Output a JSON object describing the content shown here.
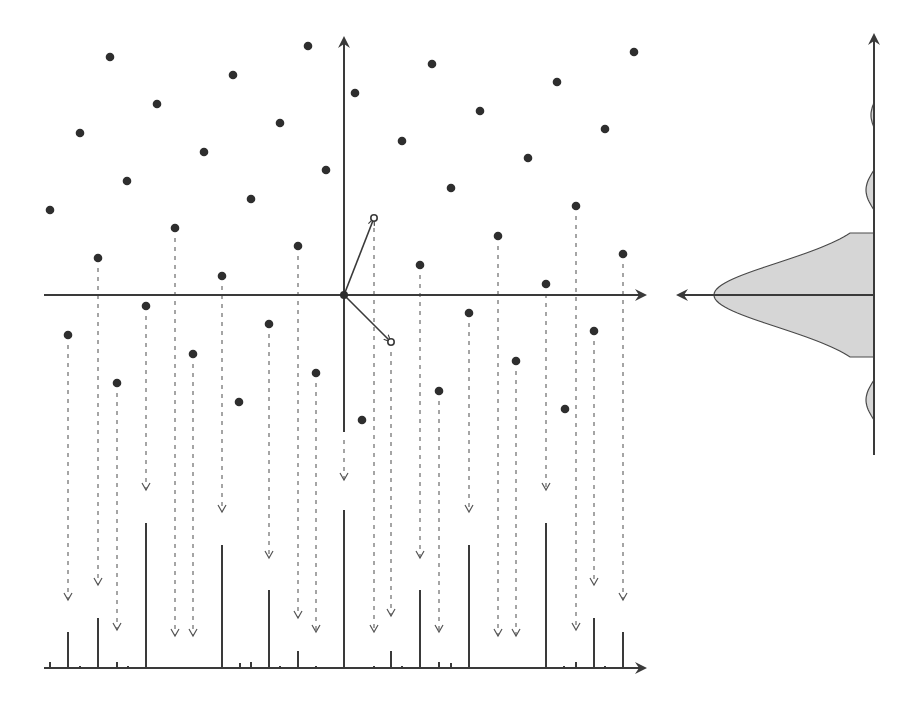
{
  "diagram": {
    "title": "",
    "colors": {
      "axis": "#3a3a3a",
      "dot": "#2e2e2e",
      "dash": "#6a6a6a",
      "profile_fill": "#d6d6d6"
    },
    "main_axes": {
      "origin": [
        344,
        295
      ],
      "x_axis": {
        "x1": 44,
        "x2": 645,
        "y": 295
      },
      "y_axis": {
        "x": 344,
        "y1": 38,
        "y2": 432
      }
    },
    "basis_vectors": [
      {
        "name": "basis-vector-1",
        "to": [
          374,
          218
        ]
      },
      {
        "name": "basis-vector-2",
        "to": [
          391,
          342
        ]
      }
    ],
    "points": [
      [
        110,
        57
      ],
      [
        308,
        46
      ],
      [
        233,
        75
      ],
      [
        157,
        104
      ],
      [
        80,
        133
      ],
      [
        280,
        123
      ],
      [
        204,
        152
      ],
      [
        127,
        181
      ],
      [
        326,
        170
      ],
      [
        50,
        210
      ],
      [
        251,
        199
      ],
      [
        175,
        228
      ],
      [
        98,
        258
      ],
      [
        298,
        246
      ],
      [
        222,
        276
      ],
      [
        355,
        93
      ],
      [
        432,
        64
      ],
      [
        480,
        111
      ],
      [
        402,
        141
      ],
      [
        528,
        158
      ],
      [
        451,
        188
      ],
      [
        557,
        82
      ],
      [
        605,
        129
      ],
      [
        634,
        52
      ],
      [
        576,
        206
      ],
      [
        498,
        236
      ],
      [
        420,
        265
      ],
      [
        546,
        284
      ],
      [
        623,
        254
      ],
      [
        68,
        335
      ],
      [
        146,
        306
      ],
      [
        117,
        383
      ],
      [
        193,
        354
      ],
      [
        269,
        324
      ],
      [
        239,
        402
      ],
      [
        316,
        373
      ],
      [
        362,
        420
      ],
      [
        469,
        313
      ],
      [
        516,
        361
      ],
      [
        439,
        391
      ],
      [
        565,
        409
      ],
      [
        594,
        331
      ]
    ],
    "projections": [
      {
        "x": 68,
        "y0": 345,
        "y1": 600
      },
      {
        "x": 98,
        "y0": 268,
        "y1": 585
      },
      {
        "x": 117,
        "y0": 393,
        "y1": 630
      },
      {
        "x": 146,
        "y0": 316,
        "y1": 490
      },
      {
        "x": 175,
        "y0": 238,
        "y1": 636
      },
      {
        "x": 193,
        "y0": 364,
        "y1": 636
      },
      {
        "x": 222,
        "y0": 286,
        "y1": 512
      },
      {
        "x": 269,
        "y0": 334,
        "y1": 558
      },
      {
        "x": 298,
        "y0": 256,
        "y1": 618
      },
      {
        "x": 316,
        "y0": 383,
        "y1": 632
      },
      {
        "x": 344,
        "y0": 440,
        "y1": 480
      },
      {
        "x": 374,
        "y0": 228,
        "y1": 632
      },
      {
        "x": 391,
        "y0": 352,
        "y1": 616
      },
      {
        "x": 420,
        "y0": 275,
        "y1": 558
      },
      {
        "x": 439,
        "y0": 401,
        "y1": 632
      },
      {
        "x": 469,
        "y0": 323,
        "y1": 512
      },
      {
        "x": 498,
        "y0": 246,
        "y1": 636
      },
      {
        "x": 516,
        "y0": 371,
        "y1": 636
      },
      {
        "x": 546,
        "y0": 294,
        "y1": 490
      },
      {
        "x": 576,
        "y0": 216,
        "y1": 630
      },
      {
        "x": 594,
        "y0": 341,
        "y1": 585
      },
      {
        "x": 623,
        "y0": 264,
        "y1": 600
      }
    ],
    "bottom_axis": {
      "x1": 44,
      "x2": 645,
      "y": 668
    },
    "stems": [
      {
        "x": 50,
        "h": 6
      },
      {
        "x": 68,
        "h": 36
      },
      {
        "x": 80,
        "h": 2
      },
      {
        "x": 98,
        "h": 50
      },
      {
        "x": 117,
        "h": 6
      },
      {
        "x": 128,
        "h": 2
      },
      {
        "x": 146,
        "h": 145
      },
      {
        "x": 193,
        "h": 1
      },
      {
        "x": 222,
        "h": 123
      },
      {
        "x": 240,
        "h": 5
      },
      {
        "x": 251,
        "h": 6
      },
      {
        "x": 269,
        "h": 78
      },
      {
        "x": 280,
        "h": 2
      },
      {
        "x": 298,
        "h": 17
      },
      {
        "x": 316,
        "h": 2
      },
      {
        "x": 344,
        "h": 158
      },
      {
        "x": 374,
        "h": 2
      },
      {
        "x": 391,
        "h": 17
      },
      {
        "x": 402,
        "h": 2
      },
      {
        "x": 420,
        "h": 78
      },
      {
        "x": 439,
        "h": 6
      },
      {
        "x": 451,
        "h": 5
      },
      {
        "x": 469,
        "h": 123
      },
      {
        "x": 498,
        "h": 1
      },
      {
        "x": 546,
        "h": 145
      },
      {
        "x": 564,
        "h": 2
      },
      {
        "x": 576,
        "h": 6
      },
      {
        "x": 594,
        "h": 50
      },
      {
        "x": 605,
        "h": 2
      },
      {
        "x": 623,
        "h": 36
      }
    ],
    "profile_panel": {
      "v_axis": {
        "x": 874,
        "y1": 35,
        "y2": 455
      },
      "h_arrow": {
        "x1": 874,
        "x2": 678,
        "y": 295
      },
      "peak_x": 714,
      "center_y": 295,
      "sidelobes": [
        {
          "y": 190,
          "w": 8,
          "h": 40
        },
        {
          "y": 400,
          "w": 8,
          "h": 40
        },
        {
          "y": 115,
          "w": 3,
          "h": 25
        }
      ]
    }
  }
}
